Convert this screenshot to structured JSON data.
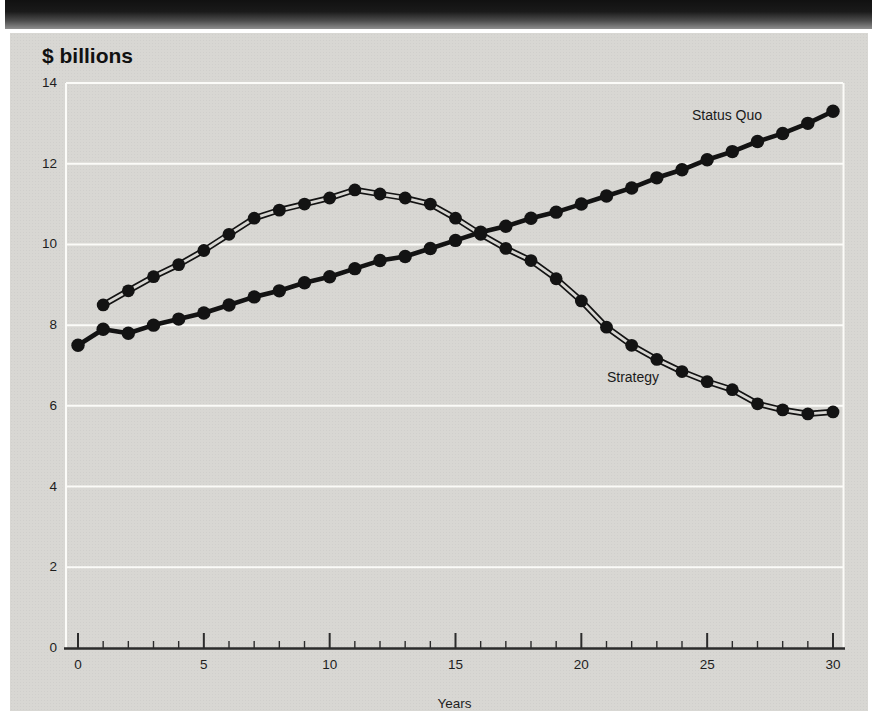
{
  "chart": {
    "title": "$ billions",
    "xlabel": "Years",
    "series_labels": {
      "status_quo": "Status Quo",
      "strategy": "Strategy"
    }
  },
  "appearance": {
    "page_bg": "#ffffff",
    "banner_top": "#111111",
    "banner_bottom": "#8e8e8e",
    "panel_bg": "#d8d7d3",
    "grid_color": "#fbfbf8",
    "axis_color": "#2b2b2b",
    "series_color": "#131313",
    "label_color": "#1e1e1e"
  },
  "chart_data": {
    "type": "line",
    "title": "$ billions",
    "xlabel": "Years",
    "ylabel": "$ billions",
    "xlim": [
      0,
      30
    ],
    "ylim": [
      0,
      14
    ],
    "x_ticks": [
      0,
      5,
      10,
      15,
      20,
      25,
      30
    ],
    "x_minor_ticks_every": 1,
    "y_ticks": [
      0,
      2,
      4,
      6,
      8,
      10,
      12,
      14
    ],
    "grid": "horizontal white gridlines every 2 units; white border lines at left and right of plot area",
    "legend": "inline text labels next to each curve",
    "marker": "filled black circles at every yearly point",
    "series": [
      {
        "name": "Status Quo",
        "style": "thick solid black line with dot markers",
        "x": [
          0,
          1,
          2,
          3,
          4,
          5,
          6,
          7,
          8,
          9,
          10,
          11,
          12,
          13,
          14,
          15,
          16,
          17,
          18,
          19,
          20,
          21,
          22,
          23,
          24,
          25,
          26,
          27,
          28,
          29,
          30
        ],
        "values": [
          7.5,
          7.9,
          7.8,
          8.0,
          8.15,
          8.3,
          8.5,
          8.7,
          8.85,
          9.05,
          9.2,
          9.4,
          9.6,
          9.7,
          9.9,
          10.1,
          10.3,
          10.45,
          10.65,
          10.8,
          11.0,
          11.2,
          11.4,
          11.65,
          11.85,
          12.1,
          12.3,
          12.55,
          12.75,
          13.0,
          13.3
        ]
      },
      {
        "name": "Strategy",
        "style": "double thin outline line (gray core) with dot markers",
        "x": [
          1,
          2,
          3,
          4,
          5,
          6,
          7,
          8,
          9,
          10,
          11,
          12,
          13,
          14,
          15,
          16,
          17,
          18,
          19,
          20,
          21,
          22,
          23,
          24,
          25,
          26,
          27,
          28,
          29,
          30
        ],
        "values": [
          8.5,
          8.85,
          9.2,
          9.5,
          9.85,
          10.25,
          10.65,
          10.85,
          11.0,
          11.15,
          11.35,
          11.25,
          11.15,
          11.0,
          10.65,
          10.25,
          9.9,
          9.6,
          9.15,
          8.6,
          7.95,
          7.5,
          7.15,
          6.85,
          6.6,
          6.4,
          6.05,
          5.9,
          5.8,
          5.85
        ]
      }
    ],
    "annotations": [
      {
        "text": "Status Quo",
        "near": {
          "year": 26,
          "value": 13.2
        }
      },
      {
        "text": "Strategy",
        "near": {
          "year": 22,
          "value": 6.7
        }
      }
    ]
  }
}
